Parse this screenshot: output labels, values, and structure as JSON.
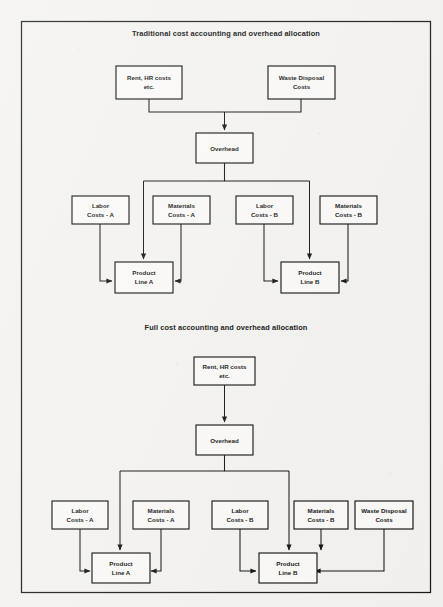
{
  "page": {
    "background_color": "#f4f3f1",
    "border_color": "#1a1a1a",
    "box_fill": "#fbfaf8",
    "line_color": "#101010",
    "text_color": "#101010"
  },
  "diagrams": [
    {
      "id": "traditional",
      "title": "Traditional cost accounting and overhead allocation",
      "nodes": {
        "rent": {
          "line1": "Rent, HR costs",
          "line2": "etc."
        },
        "waste": {
          "line1": "Waste Disposal",
          "line2": "Costs"
        },
        "overhead": {
          "line1": "Overhead",
          "line2": ""
        },
        "labor_a": {
          "line1": "Labor",
          "line2": "Costs - A"
        },
        "materials_a": {
          "line1": "Materials",
          "line2": "Costs - A"
        },
        "labor_b": {
          "line1": "Labor",
          "line2": "Costs - B"
        },
        "materials_b": {
          "line1": "Materials",
          "line2": "Costs - B"
        },
        "product_a": {
          "line1": "Product",
          "line2": "Line A"
        },
        "product_b": {
          "line1": "Product",
          "line2": "Line B"
        }
      },
      "edges": [
        {
          "from": "rent",
          "to": "overhead"
        },
        {
          "from": "waste",
          "to": "overhead"
        },
        {
          "from": "overhead",
          "to": "product_a"
        },
        {
          "from": "overhead",
          "to": "product_b"
        },
        {
          "from": "labor_a",
          "to": "product_a"
        },
        {
          "from": "materials_a",
          "to": "product_a"
        },
        {
          "from": "labor_b",
          "to": "product_b"
        },
        {
          "from": "materials_b",
          "to": "product_b"
        }
      ]
    },
    {
      "id": "full",
      "title": "Full cost accounting and overhead allocation",
      "nodes": {
        "rent": {
          "line1": "Rent, HR costs",
          "line2": "etc."
        },
        "overhead": {
          "line1": "Overhead",
          "line2": ""
        },
        "labor_a": {
          "line1": "Labor",
          "line2": "Costs - A"
        },
        "materials_a": {
          "line1": "Materials",
          "line2": "Costs - A"
        },
        "labor_b": {
          "line1": "Labor",
          "line2": "Costs - B"
        },
        "materials_b": {
          "line1": "Materials",
          "line2": "Costs - B"
        },
        "waste": {
          "line1": "Waste Disposal",
          "line2": "Costs"
        },
        "product_a": {
          "line1": "Product",
          "line2": "Line A"
        },
        "product_b": {
          "line1": "Product",
          "line2": "Line B"
        }
      },
      "edges": [
        {
          "from": "rent",
          "to": "overhead"
        },
        {
          "from": "overhead",
          "to": "product_a"
        },
        {
          "from": "overhead",
          "to": "product_b"
        },
        {
          "from": "labor_a",
          "to": "product_a"
        },
        {
          "from": "materials_a",
          "to": "product_a"
        },
        {
          "from": "labor_b",
          "to": "product_b"
        },
        {
          "from": "materials_b",
          "to": "product_b"
        },
        {
          "from": "waste",
          "to": "product_b"
        }
      ]
    }
  ]
}
